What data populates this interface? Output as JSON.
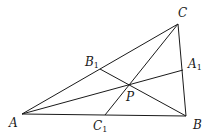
{
  "diagram": {
    "stroke_color": "#1a1a1a",
    "points": {
      "A": {
        "x": 22,
        "y": 114
      },
      "B": {
        "x": 186,
        "y": 116
      },
      "C": {
        "x": 178,
        "y": 24
      },
      "A1": {
        "x": 183,
        "y": 70
      },
      "B1": {
        "x": 100,
        "y": 69
      },
      "C1": {
        "x": 105,
        "y": 115
      },
      "P": {
        "x": 127,
        "y": 85
      }
    },
    "segments": [
      [
        "A",
        "B"
      ],
      [
        "B",
        "C"
      ],
      [
        "C",
        "A"
      ],
      [
        "A",
        "A1"
      ],
      [
        "B",
        "B1"
      ],
      [
        "C",
        "C1"
      ]
    ],
    "labels": {
      "A": {
        "text": "A",
        "sub": ""
      },
      "B": {
        "text": "B",
        "sub": ""
      },
      "C": {
        "text": "C",
        "sub": ""
      },
      "A1": {
        "text": "A",
        "sub": "1"
      },
      "B1": {
        "text": "B",
        "sub": "1"
      },
      "C1": {
        "text": "C",
        "sub": "1"
      },
      "P": {
        "text": "P",
        "sub": ""
      }
    }
  }
}
